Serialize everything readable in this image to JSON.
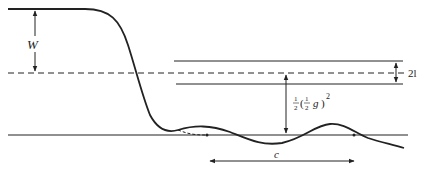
{
  "diagram": {
    "type": "wave profile / bore schematic",
    "labels": {
      "W": "W",
      "amplitude_label": "2l",
      "c": "c",
      "half": "1",
      "half_den": "2",
      "inner_half": "1",
      "inner_half_den": "2",
      "g": "g",
      "exp": "2",
      "paren_open": "(",
      "paren_close": ")"
    },
    "colors": {
      "stroke": "#222222",
      "background": "#ffffff"
    }
  }
}
